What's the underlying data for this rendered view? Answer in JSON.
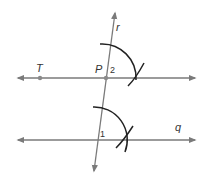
{
  "diagram": {
    "colors": {
      "line": "#7a7a7a",
      "arc": "#222222",
      "point": "#8a8a8a",
      "text": "#333333",
      "background": "#ffffff"
    },
    "labels": {
      "transversal": "r",
      "point_p": "P",
      "point_t": "T",
      "angle_upper": "2",
      "angle_lower": "1",
      "lower_line": "q"
    },
    "elements": {
      "lines": [
        {
          "name": "transversal-r",
          "from": [
            94,
            172
          ],
          "to": [
            115,
            12
          ]
        },
        {
          "name": "line-through-T-P",
          "from": [
            17,
            78
          ],
          "to": [
            195,
            78
          ]
        },
        {
          "name": "line-q",
          "from": [
            17,
            140
          ],
          "to": [
            195,
            140
          ]
        }
      ],
      "points": [
        {
          "name": "T",
          "at": [
            40,
            78
          ]
        },
        {
          "name": "P",
          "at": [
            106,
            78
          ]
        }
      ]
    }
  }
}
